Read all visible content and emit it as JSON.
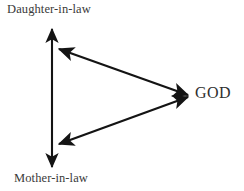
{
  "diagram": {
    "background_color": "#ffffff",
    "stroke_color": "#141414",
    "nodes": [
      {
        "id": "daughter",
        "label": "Daughter-in-law",
        "position": "top-left"
      },
      {
        "id": "mother",
        "label": "Mother-in-law",
        "position": "bottom-left"
      },
      {
        "id": "god",
        "label": "GOD",
        "position": "right"
      }
    ],
    "edges": [
      {
        "id": "edge-daughter-mother",
        "from": "daughter",
        "to": "mother",
        "style": "double-headed-arrow",
        "orientation": "vertical"
      },
      {
        "id": "edge-daughter-god",
        "from": "daughter",
        "to": "god",
        "style": "double-headed-arrow",
        "orientation": "diagonal-upper"
      },
      {
        "id": "edge-mother-god",
        "from": "mother",
        "to": "god",
        "style": "double-headed-arrow",
        "orientation": "diagonal-lower"
      }
    ]
  }
}
